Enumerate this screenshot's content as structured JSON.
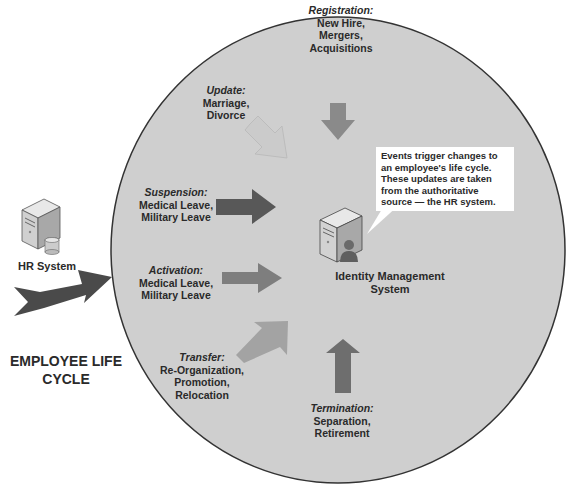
{
  "diagram": {
    "title": "EMPLOYEE LIFE CYCLE",
    "source": {
      "label": "HR System",
      "icon": "server-database-icon"
    },
    "target": {
      "label": "Identity Management System",
      "icon": "server-user-icon"
    },
    "callout": "Events trigger changes to an employee's life cycle. These updates are taken from the authoritative source — the HR system.",
    "events": [
      {
        "id": "registration",
        "title": "Registration:",
        "lines": [
          "New Hire,",
          "Mergers,",
          "Acquisitions"
        ],
        "arrow_color": "#8a8a8a",
        "direction": "down"
      },
      {
        "id": "update",
        "title": "Update:",
        "lines": [
          "Marriage,",
          "Divorce"
        ],
        "arrow_color": "#cbcbcb",
        "direction": "down-right"
      },
      {
        "id": "suspension",
        "title": "Suspension:",
        "lines": [
          "Medical Leave,",
          "Military Leave"
        ],
        "arrow_color": "#585858",
        "direction": "right"
      },
      {
        "id": "activation",
        "title": "Activation:",
        "lines": [
          "Medical Leave,",
          "Military Leave"
        ],
        "arrow_color": "#7e7e7e",
        "direction": "right"
      },
      {
        "id": "transfer",
        "title": "Transfer:",
        "lines": [
          "Re-Organization,",
          "Promotion,",
          "Relocation"
        ],
        "arrow_color": "#a3a3a3",
        "direction": "up-right"
      },
      {
        "id": "termination",
        "title": "Termination:",
        "lines": [
          "Separation,",
          "Retirement"
        ],
        "arrow_color": "#6e6e6e",
        "direction": "up"
      }
    ],
    "colors": {
      "circle_fill": "#cfcfcf",
      "circle_stroke": "#333333",
      "main_arrow": "#4a4a4a"
    }
  }
}
